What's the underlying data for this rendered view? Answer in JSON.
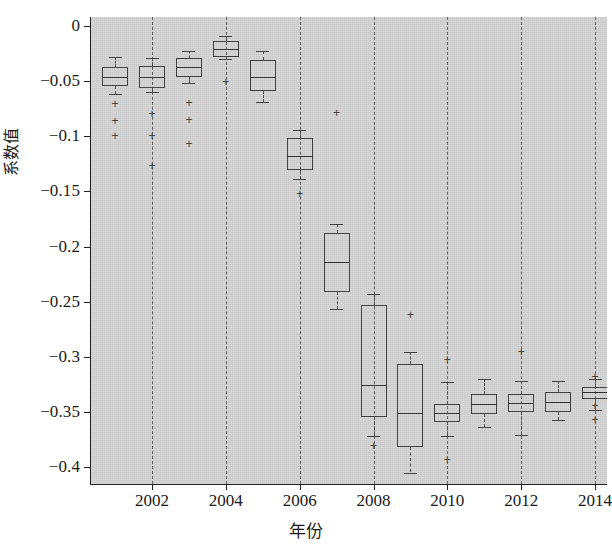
{
  "chart_data": {
    "type": "box",
    "title": "",
    "xlabel": "年份",
    "ylabel": "系数值",
    "xtick_labels": [
      "2002",
      "2004",
      "2006",
      "2008",
      "2010",
      "2012",
      "2014"
    ],
    "xtick_values": [
      2002,
      2004,
      2006,
      2008,
      2010,
      2012,
      2014
    ],
    "ytick_labels": [
      "0",
      "−0.05",
      "−0.1",
      "−0.15",
      "−0.2",
      "−0.25",
      "−0.3",
      "−0.35",
      "−0.4"
    ],
    "ytick_values": [
      0,
      -0.05,
      -0.1,
      -0.15,
      -0.2,
      -0.25,
      -0.3,
      -0.35,
      -0.4
    ],
    "ylim": [
      -0.425,
      0.012
    ],
    "xlim": [
      2000.4,
      2014.6
    ],
    "grid": "vertical-dashed-at-even-years",
    "legend": null,
    "plot_background": "#d4d4d4",
    "box_line_color": "#3a3a3a",
    "categories": [
      2001,
      2002,
      2003,
      2004,
      2005,
      2006,
      2007,
      2008,
      2009,
      2010,
      2011,
      2012,
      2013,
      2014
    ],
    "boxes": [
      {
        "year": 2001,
        "whisker_low": -0.062,
        "q1": -0.054,
        "median": -0.046,
        "q3": -0.037,
        "whisker_high": -0.028,
        "outliers": [
          -0.071,
          -0.086,
          -0.1
        ]
      },
      {
        "year": 2002,
        "whisker_low": -0.06,
        "q1": -0.056,
        "median": -0.046,
        "q3": -0.036,
        "whisker_high": -0.029,
        "outliers": [
          -0.08,
          -0.1,
          -0.127
        ]
      },
      {
        "year": 2003,
        "whisker_low": -0.052,
        "q1": -0.046,
        "median": -0.037,
        "q3": -0.029,
        "whisker_high": -0.023,
        "outliers": [
          -0.07,
          -0.085,
          -0.107
        ]
      },
      {
        "year": 2004,
        "whisker_low": -0.03,
        "q1": -0.028,
        "median": -0.021,
        "q3": -0.014,
        "whisker_high": -0.009,
        "outliers": [
          -0.051
        ]
      },
      {
        "year": 2005,
        "whisker_low": -0.069,
        "q1": -0.059,
        "median": -0.046,
        "q3": -0.031,
        "whisker_high": -0.023,
        "outliers": []
      },
      {
        "year": 2006,
        "whisker_low": -0.139,
        "q1": -0.131,
        "median": -0.118,
        "q3": -0.102,
        "whisker_high": -0.094,
        "outliers": [
          -0.152
        ]
      },
      {
        "year": 2007,
        "whisker_low": -0.257,
        "q1": -0.241,
        "median": -0.214,
        "q3": -0.188,
        "whisker_high": -0.18,
        "outliers": [
          -0.079
        ]
      },
      {
        "year": 2008,
        "whisker_low": -0.372,
        "q1": -0.355,
        "median": -0.326,
        "q3": -0.253,
        "whisker_high": -0.243,
        "outliers": [
          -0.381
        ]
      },
      {
        "year": 2009,
        "whisker_low": -0.405,
        "q1": -0.382,
        "median": -0.351,
        "q3": -0.307,
        "whisker_high": -0.296,
        "outliers": [
          -0.262
        ]
      },
      {
        "year": 2010,
        "whisker_low": -0.372,
        "q1": -0.359,
        "median": -0.351,
        "q3": -0.343,
        "whisker_high": -0.323,
        "outliers": [
          -0.303,
          -0.394
        ]
      },
      {
        "year": 2011,
        "whisker_low": -0.364,
        "q1": -0.352,
        "median": -0.343,
        "q3": -0.334,
        "whisker_high": -0.32,
        "outliers": []
      },
      {
        "year": 2012,
        "whisker_low": -0.371,
        "q1": -0.35,
        "median": -0.342,
        "q3": -0.334,
        "whisker_high": -0.322,
        "outliers": [
          -0.296
        ]
      },
      {
        "year": 2013,
        "whisker_low": -0.357,
        "q1": -0.35,
        "median": -0.341,
        "q3": -0.332,
        "whisker_high": -0.322,
        "outliers": []
      },
      {
        "year": 2014,
        "whisker_low": -0.348,
        "q1": -0.338,
        "median": -0.332,
        "q3": -0.327,
        "whisker_high": -0.32,
        "outliers": [
          -0.318,
          -0.345,
          -0.357
        ]
      }
    ]
  }
}
